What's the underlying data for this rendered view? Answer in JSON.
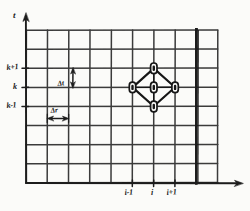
{
  "figure": {
    "kind": "finite-difference-grid-stencil",
    "style": "hand-drawn pencil sketch on paper",
    "ink_color": "#262626",
    "grid_color": "#3a3a3a",
    "paper_color": "#fbfbf9"
  },
  "axes": {
    "vertical": {
      "name": "t",
      "arrow": "up",
      "x_px": 26,
      "top_px": 14,
      "bottom_px": 183
    },
    "horizontal": {
      "name": "",
      "arrow": "right",
      "y_px": 183,
      "left_px": 26,
      "right_px": 243
    }
  },
  "grid": {
    "columns": 9,
    "rows": 8,
    "left_px": 26,
    "top_px": 30,
    "cell_w_px": 21.3,
    "cell_h_px": 19.1,
    "x_lines": [
      26,
      47.3,
      68.6,
      89.9,
      111.2,
      132.5,
      153.8,
      175.1,
      196.4,
      217.7
    ],
    "y_lines": [
      30,
      49.1,
      68.2,
      87.3,
      106.4,
      125.5,
      144.6,
      163.7,
      182.8
    ]
  },
  "y_ticks": [
    {
      "label": "k+1",
      "y_px": 68.2
    },
    {
      "label": "k",
      "y_px": 87.3
    },
    {
      "label": "k-1",
      "y_px": 106.4
    }
  ],
  "x_ticks": [
    {
      "label": "i-1",
      "x_px": 132.5
    },
    {
      "label": "i",
      "x_px": 153.8
    },
    {
      "label": "i+1",
      "x_px": 175.1
    }
  ],
  "dimension_markers": [
    {
      "label": "Δt",
      "orientation": "vertical",
      "double_arrow": true,
      "x_px": 73,
      "from_y_px": 68.2,
      "to_y_px": 87.3
    },
    {
      "label": "Δr",
      "orientation": "horizontal",
      "double_arrow": true,
      "y_px": 118,
      "from_x_px": 47.3,
      "to_x_px": 68.6
    }
  ],
  "stencil": {
    "shape": "diamond",
    "center": {
      "label": "i,k",
      "x_px": 153.8,
      "y_px": 87.3
    },
    "vertices": [
      {
        "label": "i,k+1",
        "x_px": 153.8,
        "y_px": 68.2
      },
      {
        "label": "i+1,k",
        "x_px": 175.1,
        "y_px": 87.3
      },
      {
        "label": "i,k-1",
        "x_px": 153.8,
        "y_px": 106.4
      },
      {
        "label": "i-1,k",
        "x_px": 132.5,
        "y_px": 87.3
      }
    ],
    "nodes": [
      {
        "name": "node-top",
        "x_px": 153.8,
        "y_px": 68.2
      },
      {
        "name": "node-left",
        "x_px": 132.5,
        "y_px": 87.3
      },
      {
        "name": "node-center",
        "x_px": 153.8,
        "y_px": 87.3
      },
      {
        "name": "node-right",
        "x_px": 175.1,
        "y_px": 87.3
      },
      {
        "name": "node-bottom",
        "x_px": 153.8,
        "y_px": 106.4
      }
    ],
    "node_marker": "small vertical rounded rectangle with dot"
  },
  "boundary_line": {
    "name": "right-boundary",
    "orientation": "vertical",
    "x_px": 196.4,
    "top_px": 30,
    "bottom_px": 182.8,
    "thick": true
  }
}
